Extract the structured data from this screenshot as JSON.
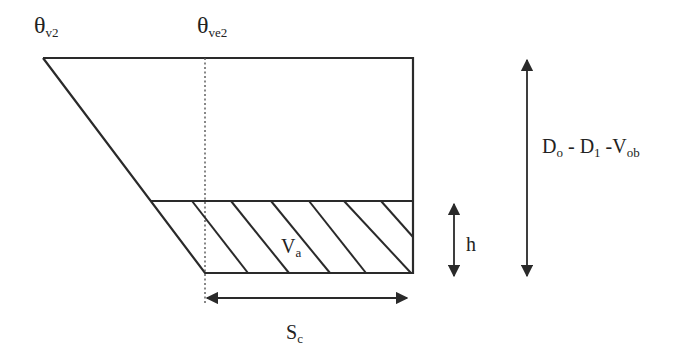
{
  "diagram": {
    "labels": {
      "theta_v2": {
        "main": "θ",
        "sub": "v2"
      },
      "theta_ve2": {
        "main": "θ",
        "sub": "ve2"
      },
      "va": {
        "main": "V",
        "sub": "a"
      },
      "h": {
        "main": "h"
      },
      "sc": {
        "main": "S",
        "sub": "c"
      },
      "depth": {
        "d0_main": "D",
        "d0_sub": "o",
        "sep1": " - ",
        "d1_main": "D",
        "d1_sub": "1",
        "sep2": " -",
        "vob_main": "V",
        "vob_sub": "ob"
      }
    },
    "colors": {
      "stroke": "#2a2a2a",
      "background": "#ffffff"
    }
  }
}
